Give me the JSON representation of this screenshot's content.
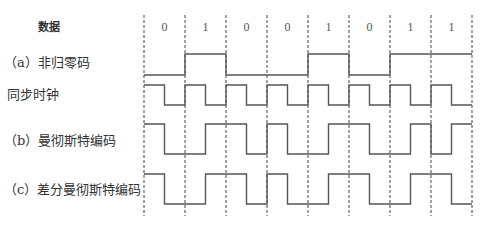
{
  "title_row": {
    "label": "数据"
  },
  "bits": [
    "0",
    "1",
    "0",
    "0",
    "1",
    "0",
    "1",
    "1"
  ],
  "rows": [
    {
      "id": "nrz",
      "label": "（a）非归零码"
    },
    {
      "id": "clock",
      "label": "同步时钟"
    },
    {
      "id": "manchester",
      "label": "（b）曼彻斯特编码"
    },
    {
      "id": "diff_manchester",
      "label": "（c）差分曼彻斯特编码"
    }
  ],
  "layout": {
    "x0": 144,
    "bit_width": 41,
    "grid_top": 15,
    "grid_bottom": 216,
    "levels": {
      "nrz": {
        "high": 54,
        "low": 75
      },
      "clock": {
        "high": 85,
        "low": 105
      },
      "manchester": {
        "high": 124,
        "low": 154
      },
      "diff_manchester": {
        "high": 174,
        "low": 204
      }
    }
  },
  "waveforms": {
    "nrz": [
      0,
      0,
      1,
      1,
      0,
      0,
      0,
      0,
      1,
      1,
      0,
      0,
      1,
      1,
      1,
      1
    ],
    "clock": [
      1,
      0,
      1,
      0,
      1,
      0,
      1,
      0,
      1,
      0,
      1,
      0,
      1,
      0,
      1,
      0
    ],
    "manchester": [
      1,
      0,
      0,
      1,
      1,
      0,
      1,
      0,
      0,
      1,
      1,
      0,
      0,
      1,
      0,
      1
    ],
    "diff_manchester": [
      1,
      0,
      0,
      1,
      1,
      0,
      1,
      0,
      0,
      1,
      1,
      0,
      0,
      1,
      1,
      0
    ]
  },
  "colors": {
    "line": "#555555",
    "grid": "#444444",
    "text": "#333333"
  }
}
